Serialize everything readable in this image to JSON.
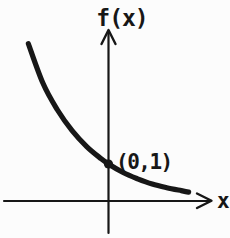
{
  "figure": {
    "y_axis_label": "f(x)",
    "x_axis_label": "x",
    "ink_color": "#171717",
    "background_color": "#fcfcfc"
  },
  "chart_data": {
    "type": "line",
    "title": "",
    "xlabel": "x",
    "ylabel": "f(x)",
    "grid": false,
    "legend": false,
    "xlim": [
      -2.85,
      3.3
    ],
    "ylim": [
      -1.0,
      4.6
    ],
    "series": [
      {
        "name": "f(x)",
        "x": [
          -2.2,
          -1.8,
          -1.4,
          -1.0,
          -0.6,
          -0.2,
          0.0,
          0.4,
          0.8,
          1.2,
          1.6,
          2.0,
          2.2
        ],
        "y": [
          4.25,
          3.18,
          2.46,
          1.9,
          1.47,
          1.14,
          1.0,
          0.77,
          0.6,
          0.46,
          0.36,
          0.28,
          0.24
        ]
      }
    ],
    "annotations": [
      {
        "text": "(0,1)",
        "x": 0,
        "y": 1,
        "marker": "dot"
      }
    ]
  }
}
